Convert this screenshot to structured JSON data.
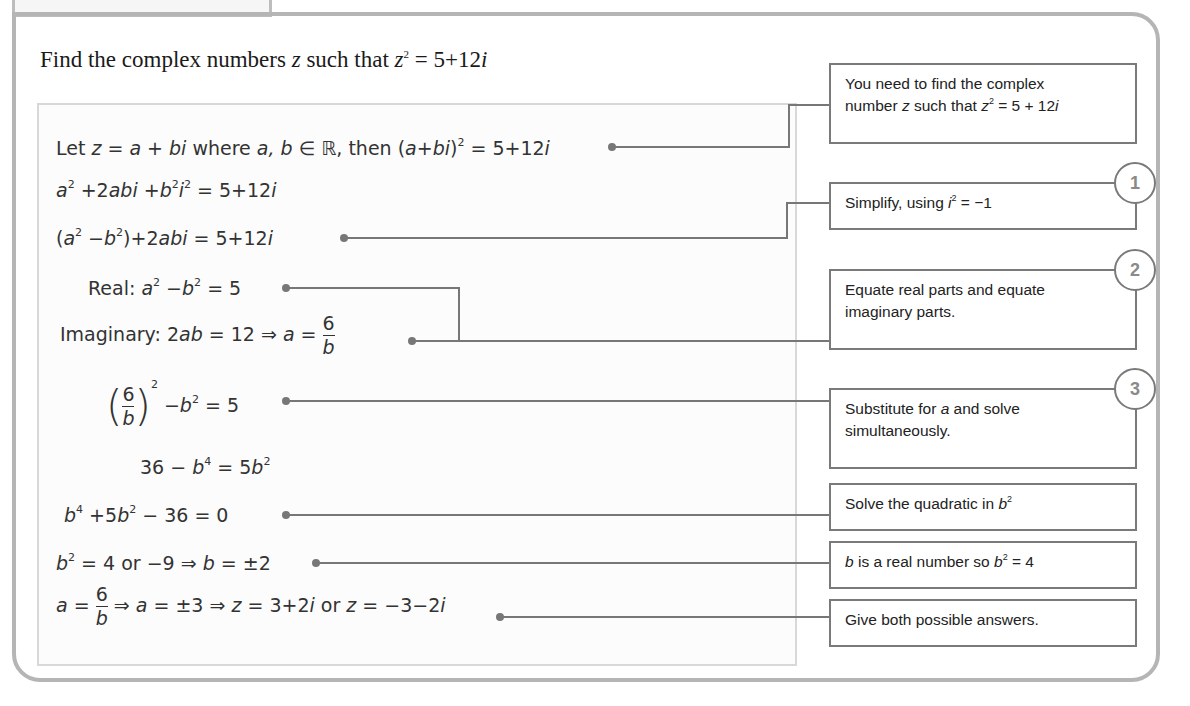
{
  "question": {
    "prefix": "Find the complex numbers ",
    "var": "z",
    "mid": " such that ",
    "var2": "z",
    "exp": "2",
    "rhs": " = 5+12",
    "i": "i"
  },
  "working": {
    "line1": {
      "a": "Let ",
      "z": "z",
      "eq": " = ",
      "abi": "a + bi",
      "where": " where ",
      "ab": "a, b",
      "in": " ∈ ℝ, then (",
      "abi2": "a+bi",
      "close": ")",
      "sq": "2",
      "rhs": " = 5+12",
      "i": "i"
    },
    "line2": {
      "a": "a",
      "sq": "2",
      "p1": " +2",
      "abi": "abi",
      "p2": " +",
      "b": "b",
      "sq2": "2",
      "i": "i",
      "sq3": "2",
      "rhs": " = 5+12",
      "i2": "i"
    },
    "line3": {
      "open": "(",
      "a": "a",
      "sq": "2",
      "minus": " −",
      "b": "b",
      "sq2": "2",
      "close": ")+2",
      "abi": "abi",
      "rhs": " = 5+12",
      "i": "i"
    },
    "line4": {
      "label": "Real: ",
      "a": "a",
      "sq": "2",
      "minus": " −",
      "b": "b",
      "sq2": "2",
      "rhs": " = 5"
    },
    "line5": {
      "label": "Imaginary: 2",
      "ab": "ab",
      "eq": " = 12 ⇒ ",
      "a": "a",
      "eq2": " = ",
      "num": "6",
      "den": "b"
    },
    "line6": {
      "num": "6",
      "den": "b",
      "sq": "2",
      "minus": " −",
      "b": "b",
      "sq2": "2",
      "rhs": " = 5"
    },
    "line7": {
      "lhs": "36 − ",
      "b": "b",
      "p4": "4",
      "eq": " = 5",
      "b2": "b",
      "sq": "2"
    },
    "line8": {
      "b": "b",
      "p4": "4",
      "p1": " +5",
      "b2": "b",
      "sq": "2",
      "rhs": " − 36 = 0"
    },
    "line9": {
      "b": "b",
      "sq": "2",
      "mid": " = 4 or −9 ⇒ ",
      "b2": "b",
      "rhs": " = ±2"
    },
    "line10": {
      "a": "a",
      "eq": " = ",
      "num": "6",
      "den": "b",
      "mid": " ⇒ ",
      "a2": "a",
      "mid2": " = ±3 ⇒ ",
      "z": "z",
      "ans1": " = 3+2",
      "i": "i",
      "or": " or ",
      "z2": "z",
      "ans2": " = −3−2",
      "i2": "i"
    }
  },
  "notes": [
    {
      "l1": "You need to find the complex",
      "l2a": "number ",
      "z": "z",
      "l2b": " such that ",
      "z2": "z",
      "sq": "2",
      "l2c": " = 5 + 12",
      "i": "i"
    },
    {
      "a": "Simplify, using ",
      "i": "i",
      "sq": "2",
      "b": " = −1",
      "badge": "1"
    },
    {
      "l1": "Equate real parts and equate",
      "l2": "imaginary parts.",
      "badge": "2"
    },
    {
      "a": "Substitute for ",
      "v": "a",
      "b": " and solve",
      "l2": "simultaneously.",
      "badge": "3"
    },
    {
      "a": "Solve the quadratic in ",
      "v": "b",
      "sq": "2"
    },
    {
      "v": "b",
      "a": " is a real number so ",
      "v2": "b",
      "sq": "2",
      "b": " = 4"
    },
    {
      "a": "Give both possible answers."
    }
  ]
}
